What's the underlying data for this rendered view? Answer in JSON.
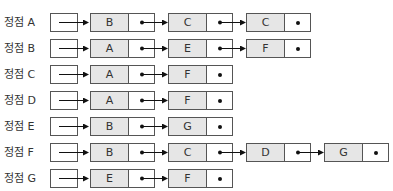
{
  "diagram": {
    "type": "adjacency-list",
    "rows": [
      {
        "label": "정점 A",
        "nodes": [
          "B",
          "C",
          "C"
        ]
      },
      {
        "label": "정점 B",
        "nodes": [
          "A",
          "E",
          "F"
        ]
      },
      {
        "label": "정점 C",
        "nodes": [
          "A",
          "F"
        ]
      },
      {
        "label": "정점 D",
        "nodes": [
          "A",
          "F"
        ]
      },
      {
        "label": "정점 E",
        "nodes": [
          "B",
          "G"
        ]
      },
      {
        "label": "정점 F",
        "nodes": [
          "B",
          "C",
          "D",
          "G"
        ]
      },
      {
        "label": "정점 G",
        "nodes": [
          "E",
          "F"
        ]
      }
    ]
  },
  "colors": {
    "node_fill": "#e6e6e6",
    "border": "#555555",
    "arrow": "#111111"
  }
}
